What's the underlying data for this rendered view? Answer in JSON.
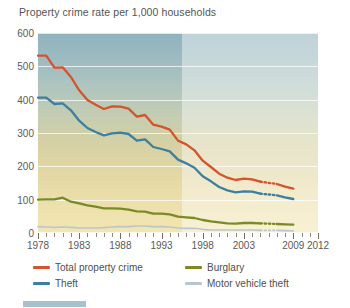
{
  "chart_data": {
    "type": "line",
    "title": "Property crime rate per 1,000 households",
    "xlabel": "",
    "ylabel": "",
    "xlim": [
      1978,
      2012
    ],
    "ylim": [
      0,
      600
    ],
    "grid": true,
    "legend_position": "bottom-left",
    "y_ticks": [
      600,
      500,
      400,
      300,
      200,
      100,
      0
    ],
    "x_ticks": [
      1978,
      1983,
      1988,
      1993,
      1998,
      2003,
      2009,
      2012
    ],
    "x_tick_labels": [
      "1978",
      "1983",
      "1988",
      "1993",
      "1998",
      "2003",
      "2009",
      "2012"
    ],
    "annotations": [
      "Dotted line segments between 2005 and 2007 indicate interpolated/estimated values",
      "Background shading lightens after 1993"
    ],
    "series": [
      {
        "name": "Total property crime",
        "color": "#d4542c",
        "x": [
          1978,
          1979,
          1980,
          1981,
          1982,
          1983,
          1984,
          1985,
          1986,
          1987,
          1988,
          1989,
          1990,
          1991,
          1992,
          1993,
          1994,
          1995,
          1996,
          1997,
          1998,
          1999,
          2000,
          2001,
          2002,
          2003,
          2004,
          2005,
          2007,
          2008,
          2009
        ],
        "values": [
          532,
          532,
          496,
          497,
          468,
          428,
          399,
          385,
          372,
          380,
          379,
          373,
          349,
          354,
          325,
          319,
          310,
          277,
          266,
          248,
          217,
          198,
          178,
          166,
          159,
          163,
          161,
          154,
          147,
          139,
          133
        ]
      },
      {
        "name": "Theft",
        "color": "#3d7f9e",
        "x": [
          1978,
          1979,
          1980,
          1981,
          1982,
          1983,
          1984,
          1985,
          1986,
          1987,
          1988,
          1989,
          1990,
          1991,
          1992,
          1993,
          1994,
          1995,
          1996,
          1997,
          1998,
          1999,
          2000,
          2001,
          2002,
          2003,
          2004,
          2005,
          2007,
          2008,
          2009
        ],
        "values": [
          406,
          406,
          387,
          389,
          368,
          337,
          315,
          303,
          293,
          299,
          301,
          297,
          277,
          281,
          258,
          252,
          245,
          220,
          209,
          196,
          170,
          155,
          138,
          128,
          122,
          125,
          124,
          118,
          113,
          107,
          102
        ]
      },
      {
        "name": "Burglary",
        "color": "#7a8a25",
        "x": [
          1978,
          1979,
          1980,
          1981,
          1982,
          1983,
          1984,
          1985,
          1986,
          1987,
          1988,
          1989,
          1990,
          1991,
          1992,
          1993,
          1994,
          1995,
          1996,
          1997,
          1998,
          1999,
          2000,
          2001,
          2002,
          2003,
          2004,
          2005,
          2007,
          2008,
          2009
        ],
        "values": [
          100,
          101,
          101,
          106,
          94,
          89,
          83,
          79,
          74,
          74,
          73,
          70,
          65,
          64,
          58,
          58,
          56,
          49,
          47,
          45,
          39,
          35,
          32,
          29,
          28,
          30,
          30,
          29,
          27,
          26,
          25
        ]
      },
      {
        "name": "Motor vehicle theft",
        "color": "#b9c6cc",
        "x": [
          1978,
          1979,
          1980,
          1981,
          1982,
          1983,
          1984,
          1985,
          1986,
          1987,
          1988,
          1989,
          1990,
          1991,
          1992,
          1993,
          1994,
          1995,
          1996,
          1997,
          1998,
          1999,
          2000,
          2001,
          2002,
          2003,
          2004,
          2005,
          2007,
          2008,
          2009
        ],
        "values": [
          19,
          18,
          17,
          18,
          17,
          15,
          15,
          15,
          16,
          18,
          19,
          19,
          21,
          21,
          19,
          19,
          18,
          15,
          14,
          14,
          11,
          9,
          9,
          9,
          9,
          9,
          9,
          8,
          8,
          7,
          6
        ]
      }
    ],
    "legend": [
      {
        "label": "Total property crime",
        "color": "#d4542c"
      },
      {
        "label": "Burglary",
        "color": "#7a8a25"
      },
      {
        "label": "Theft",
        "color": "#3d7f9e"
      },
      {
        "label": "Motor vehicle theft",
        "color": "#b9c6cc"
      }
    ]
  }
}
